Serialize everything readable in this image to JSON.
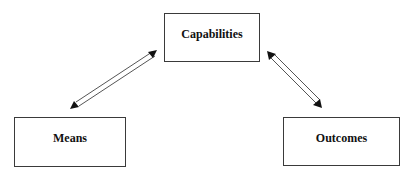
{
  "diagram": {
    "type": "triangle-relationship",
    "nodes": {
      "capabilities": "Capabilities",
      "means": "Means",
      "outcomes": "Outcomes"
    },
    "edges": [
      {
        "from": "means",
        "to": "capabilities",
        "style": "double-line bidirectional arrow"
      },
      {
        "from": "capabilities",
        "to": "outcomes",
        "style": "double-line bidirectional arrow"
      }
    ],
    "colors": {
      "stroke": "#3a3a3a",
      "text": "#111111",
      "background": "#ffffff"
    }
  }
}
